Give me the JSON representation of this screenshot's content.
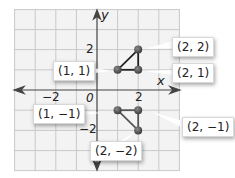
{
  "figure": {
    "type": "coordinate-plane",
    "axes": {
      "x_label": "x",
      "y_label": "y",
      "origin_label": "0",
      "x_ticks": [
        "−2",
        "2"
      ],
      "y_ticks": [
        "2",
        "−2"
      ],
      "range": [
        -4,
        4
      ]
    },
    "triangles": [
      {
        "name": "upper-triangle",
        "points": [
          {
            "x": 1,
            "y": 1,
            "label": "(1, 1)"
          },
          {
            "x": 2,
            "y": 2,
            "label": "(2, 2)"
          },
          {
            "x": 2,
            "y": 1,
            "label": "(2, 1)"
          }
        ]
      },
      {
        "name": "lower-triangle",
        "points": [
          {
            "x": 1,
            "y": -1,
            "label": "(1, −1)"
          },
          {
            "x": 2,
            "y": -1,
            "label": "(2, −1)"
          },
          {
            "x": 2,
            "y": -2,
            "label": "(2, −2)"
          }
        ]
      }
    ],
    "colors": {
      "grid": "#c8c8c8",
      "grid_bg": "#f4f4f4",
      "point": "#5a5a5a",
      "segment": "#222222",
      "axis": "#444444"
    }
  }
}
